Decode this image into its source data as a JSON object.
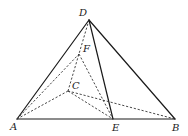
{
  "diagram": {
    "type": "geometry-pyramid",
    "points": {
      "A": {
        "label": "A",
        "x": 17,
        "y": 119,
        "lx": 10,
        "ly": 130
      },
      "B": {
        "label": "B",
        "x": 175,
        "y": 119,
        "lx": 172,
        "ly": 131
      },
      "C": {
        "label": "C",
        "x": 68,
        "y": 91,
        "lx": 72,
        "ly": 89
      },
      "D": {
        "label": "D",
        "x": 89,
        "y": 20,
        "lx": 79,
        "ly": 16
      },
      "E": {
        "label": "E",
        "x": 113,
        "y": 119,
        "lx": 112,
        "ly": 131
      },
      "F": {
        "label": "F",
        "x": 79,
        "y": 54,
        "lx": 83,
        "ly": 52
      }
    },
    "solid_edges": [
      [
        "D",
        "A"
      ],
      [
        "D",
        "B"
      ],
      [
        "D",
        "E"
      ],
      [
        "A",
        "B"
      ]
    ],
    "dashed_edges": [
      [
        "D",
        "C"
      ],
      [
        "A",
        "F"
      ],
      [
        "A",
        "C"
      ],
      [
        "F",
        "E"
      ],
      [
        "C",
        "E"
      ],
      [
        "C",
        "B"
      ]
    ]
  }
}
